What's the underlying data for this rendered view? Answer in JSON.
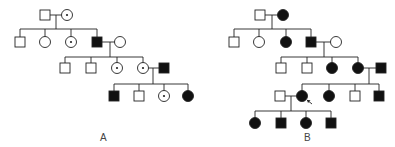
{
  "figure": {
    "type": "pedigree",
    "stroke_color": "#222222",
    "fill_affected": "#111111",
    "fill_unaffected": "#ffffff",
    "symbol_size": 10,
    "carrier_marker": "dot"
  },
  "panels": [
    {
      "id": "A",
      "label": "A",
      "label_pos": [
        103,
        140
      ],
      "individuals": [
        {
          "id": "A-I-1",
          "sex": "male",
          "status": "unaffected",
          "x": 45,
          "y": 15
        },
        {
          "id": "A-I-2",
          "sex": "female",
          "status": "carrier",
          "x": 67,
          "y": 15
        },
        {
          "id": "A-II-1",
          "sex": "male",
          "status": "unaffected",
          "x": 20,
          "y": 42
        },
        {
          "id": "A-II-2",
          "sex": "female",
          "status": "unaffected",
          "x": 45,
          "y": 42
        },
        {
          "id": "A-II-3",
          "sex": "female",
          "status": "carrier",
          "x": 71,
          "y": 42
        },
        {
          "id": "A-II-4",
          "sex": "male",
          "status": "affected",
          "x": 97,
          "y": 42
        },
        {
          "id": "A-II-5",
          "sex": "female",
          "status": "unaffected",
          "x": 120,
          "y": 42
        },
        {
          "id": "A-III-1",
          "sex": "male",
          "status": "unaffected",
          "x": 65,
          "y": 68
        },
        {
          "id": "A-III-2",
          "sex": "male",
          "status": "unaffected",
          "x": 91,
          "y": 68
        },
        {
          "id": "A-III-3",
          "sex": "female",
          "status": "carrier",
          "x": 117,
          "y": 68
        },
        {
          "id": "A-III-4",
          "sex": "female",
          "status": "carrier",
          "x": 143,
          "y": 68
        },
        {
          "id": "A-III-5",
          "sex": "male",
          "status": "affected",
          "x": 164,
          "y": 68
        },
        {
          "id": "A-IV-1",
          "sex": "male",
          "status": "affected",
          "x": 114,
          "y": 96
        },
        {
          "id": "A-IV-2",
          "sex": "male",
          "status": "unaffected",
          "x": 139,
          "y": 96
        },
        {
          "id": "A-IV-3",
          "sex": "female",
          "status": "carrier",
          "x": 164,
          "y": 96
        },
        {
          "id": "A-IV-4",
          "sex": "female",
          "status": "affected",
          "x": 188,
          "y": 96
        }
      ],
      "matings": [
        {
          "a": "A-I-1",
          "b": "A-I-2",
          "drop_x": 56,
          "sib_y": 29,
          "children": [
            "A-II-1",
            "A-II-2",
            "A-II-3",
            "A-II-4"
          ]
        },
        {
          "a": "A-II-4",
          "b": "A-II-5",
          "drop_x": 110,
          "sib_y": 57,
          "children": [
            "A-III-1",
            "A-III-2",
            "A-III-3",
            "A-III-4"
          ]
        },
        {
          "a": "A-III-4",
          "b": "A-III-5",
          "drop_x": 153,
          "sib_y": 84,
          "children": [
            "A-IV-1",
            "A-IV-2",
            "A-IV-3",
            "A-IV-4"
          ]
        }
      ]
    },
    {
      "id": "B",
      "label": "B",
      "label_pos": [
        307,
        140
      ],
      "proband": "B-IV-2",
      "individuals": [
        {
          "id": "B-I-1",
          "sex": "male",
          "status": "unaffected",
          "x": 260,
          "y": 15
        },
        {
          "id": "B-I-2",
          "sex": "female",
          "status": "affected",
          "x": 283,
          "y": 15
        },
        {
          "id": "B-II-1",
          "sex": "male",
          "status": "unaffected",
          "x": 234,
          "y": 42
        },
        {
          "id": "B-II-2",
          "sex": "female",
          "status": "unaffected",
          "x": 259,
          "y": 42
        },
        {
          "id": "B-II-3",
          "sex": "female",
          "status": "affected",
          "x": 286,
          "y": 42
        },
        {
          "id": "B-II-4",
          "sex": "male",
          "status": "affected",
          "x": 311,
          "y": 42
        },
        {
          "id": "B-II-5",
          "sex": "female",
          "status": "unaffected",
          "x": 336,
          "y": 42
        },
        {
          "id": "B-III-1",
          "sex": "male",
          "status": "unaffected",
          "x": 281,
          "y": 68
        },
        {
          "id": "B-III-2",
          "sex": "male",
          "status": "unaffected",
          "x": 307,
          "y": 68
        },
        {
          "id": "B-III-3",
          "sex": "female",
          "status": "affected",
          "x": 332,
          "y": 68
        },
        {
          "id": "B-III-4",
          "sex": "female",
          "status": "affected",
          "x": 358,
          "y": 68
        },
        {
          "id": "B-III-5",
          "sex": "male",
          "status": "affected",
          "x": 381,
          "y": 68
        },
        {
          "id": "B-IV-1",
          "sex": "male",
          "status": "unaffected",
          "x": 280,
          "y": 96
        },
        {
          "id": "B-IV-2",
          "sex": "female",
          "status": "affected",
          "x": 302,
          "y": 96
        },
        {
          "id": "B-IV-3",
          "sex": "female",
          "status": "affected",
          "x": 329,
          "y": 96
        },
        {
          "id": "B-IV-4",
          "sex": "male",
          "status": "unaffected",
          "x": 355,
          "y": 96
        },
        {
          "id": "B-IV-5",
          "sex": "male",
          "status": "affected",
          "x": 379,
          "y": 96
        },
        {
          "id": "B-V-1",
          "sex": "female",
          "status": "affected",
          "x": 255,
          "y": 123
        },
        {
          "id": "B-V-2",
          "sex": "male",
          "status": "affected",
          "x": 281,
          "y": 123
        },
        {
          "id": "B-V-3",
          "sex": "female",
          "status": "affected",
          "x": 306,
          "y": 123
        },
        {
          "id": "B-V-4",
          "sex": "male",
          "status": "affected",
          "x": 331,
          "y": 123
        }
      ],
      "matings": [
        {
          "a": "B-I-1",
          "b": "B-I-2",
          "drop_x": 272,
          "sib_y": 29,
          "children": [
            "B-II-1",
            "B-II-2",
            "B-II-3",
            "B-II-4"
          ]
        },
        {
          "a": "B-II-4",
          "b": "B-II-5",
          "drop_x": 324,
          "sib_y": 57,
          "children": [
            "B-III-1",
            "B-III-2",
            "B-III-3",
            "B-III-4"
          ]
        },
        {
          "a": "B-III-4",
          "b": "B-III-5",
          "drop_x": 369,
          "sib_y": 84,
          "children": [
            "B-IV-2",
            "B-IV-3",
            "B-IV-4",
            "B-IV-5"
          ]
        },
        {
          "a": "B-IV-1",
          "b": "B-IV-2",
          "drop_x": 291,
          "sib_y": 111,
          "children": [
            "B-V-1",
            "B-V-2",
            "B-V-3",
            "B-V-4"
          ]
        }
      ]
    }
  ]
}
